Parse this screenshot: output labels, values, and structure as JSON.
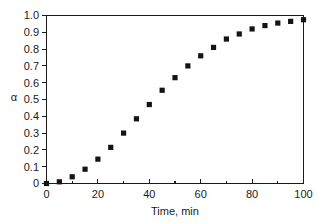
{
  "chart_data": {
    "type": "scatter",
    "title": "",
    "xlabel": "Time, min",
    "ylabel": "α",
    "xlim": [
      0,
      100
    ],
    "ylim": [
      0,
      1.0
    ],
    "xticks": [
      0,
      20,
      40,
      60,
      80,
      100
    ],
    "xtick_labels": [
      "0",
      "20",
      "40",
      "60",
      "80",
      "100"
    ],
    "xticks_minor": [
      10,
      30,
      50,
      70,
      90
    ],
    "yticks": [
      0,
      0.1,
      0.2,
      0.3,
      0.4,
      0.5,
      0.6,
      0.7,
      0.8,
      0.9,
      1.0
    ],
    "ytick_labels": [
      "0",
      "0.1",
      "0.2",
      "0.3",
      "0.4",
      "0.5",
      "0.6",
      "0.7",
      "0.8",
      "0.9",
      "1.0"
    ],
    "grid": false,
    "legend": null,
    "marker": "square",
    "marker_color": "#141414",
    "series": [
      {
        "name": "alpha",
        "x": [
          0,
          5,
          10,
          15,
          20,
          25,
          30,
          35,
          40,
          45,
          50,
          55,
          60,
          65,
          70,
          75,
          80,
          85,
          90,
          95,
          100
        ],
        "y": [
          0.0,
          0.01,
          0.04,
          0.085,
          0.145,
          0.215,
          0.3,
          0.385,
          0.47,
          0.555,
          0.63,
          0.7,
          0.76,
          0.81,
          0.86,
          0.89,
          0.92,
          0.94,
          0.955,
          0.965,
          0.975
        ]
      }
    ]
  },
  "axes": {
    "x_title": "Time, min",
    "y_title": "α"
  }
}
